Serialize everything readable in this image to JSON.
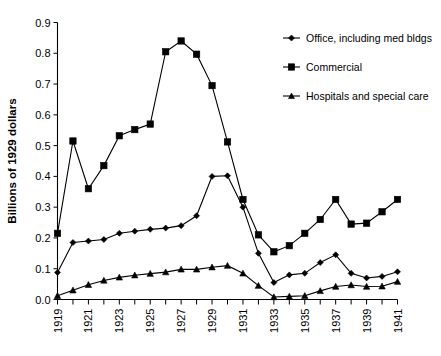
{
  "chart_data": {
    "type": "line",
    "title": "",
    "xlabel": "",
    "ylabel": "Billions of 1929 dollars",
    "ylim": [
      0.0,
      0.9
    ],
    "xlim": [
      1919,
      1941
    ],
    "grid": false,
    "legend_position": "top-right",
    "ytick_labels": [
      "0.0",
      "0.1",
      "0.2",
      "0.3",
      "0.4",
      "0.5",
      "0.6",
      "0.7",
      "0.8",
      "0.9"
    ],
    "ytick_values": [
      0.0,
      0.1,
      0.2,
      0.3,
      0.4,
      0.5,
      0.6,
      0.7,
      0.8,
      0.9
    ],
    "x": [
      1919,
      1920,
      1921,
      1922,
      1923,
      1924,
      1925,
      1926,
      1927,
      1928,
      1929,
      1930,
      1931,
      1932,
      1933,
      1934,
      1935,
      1936,
      1937,
      1938,
      1939,
      1940,
      1941
    ],
    "xtick_labels_shown": [
      "1919",
      "",
      "1921",
      "",
      "1923",
      "",
      "1925",
      "",
      "1927",
      "",
      "1929",
      "",
      "1931",
      "",
      "1933",
      "",
      "1935",
      "",
      "1937",
      "",
      "1939",
      "",
      "1941"
    ],
    "series": [
      {
        "name": "Office, including med bldgs",
        "marker": "diamond",
        "values": [
          0.088,
          0.185,
          0.19,
          0.195,
          0.215,
          0.222,
          0.228,
          0.232,
          0.24,
          0.272,
          0.4,
          0.402,
          0.3,
          0.15,
          0.055,
          0.08,
          0.085,
          0.12,
          0.145,
          0.085,
          0.07,
          0.075,
          0.09
        ]
      },
      {
        "name": "Commercial",
        "marker": "square",
        "values": [
          0.215,
          0.515,
          0.36,
          0.435,
          0.532,
          0.552,
          0.57,
          0.805,
          0.84,
          0.797,
          0.695,
          0.512,
          0.325,
          0.21,
          0.155,
          0.175,
          0.215,
          0.26,
          0.325,
          0.245,
          0.248,
          0.285,
          0.325
        ]
      },
      {
        "name": "Hospitals and special care",
        "marker": "triangle",
        "values": [
          0.012,
          0.03,
          0.048,
          0.062,
          0.072,
          0.079,
          0.084,
          0.089,
          0.098,
          0.098,
          0.105,
          0.11,
          0.085,
          0.045,
          0.008,
          0.01,
          0.012,
          0.028,
          0.042,
          0.047,
          0.042,
          0.043,
          0.058
        ]
      }
    ]
  },
  "legend": {
    "items": [
      {
        "label": "Office, including med bldgs",
        "marker": "diamond"
      },
      {
        "label": "Commercial",
        "marker": "square"
      },
      {
        "label": "Hospitals and special care",
        "marker": "triangle"
      }
    ]
  },
  "axes": {
    "y_title": "Billions of 1929 dollars"
  }
}
